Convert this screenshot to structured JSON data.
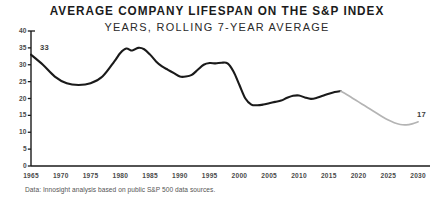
{
  "chart_data": {
    "type": "line",
    "title": "AVERAGE COMPANY LIFESPAN ON THE S&P INDEX",
    "subtitle": "YEARS, ROLLING 7-YEAR AVERAGE",
    "xlabel": "",
    "ylabel": "",
    "xlim": [
      1965,
      2032
    ],
    "ylim": [
      0,
      40
    ],
    "grid": false,
    "legend": "none",
    "xticks": [
      1965,
      1970,
      1975,
      1980,
      1985,
      1990,
      1995,
      2000,
      2005,
      2010,
      2015,
      2020,
      2025,
      2030
    ],
    "xtick_labels": [
      "1965",
      "1970",
      "1975",
      "1980",
      "1985",
      "1990",
      "1995",
      "2000",
      "2005",
      "2010",
      "2015",
      "2020",
      "2025",
      "2030"
    ],
    "yticks": [
      0,
      5,
      10,
      15,
      20,
      25,
      30,
      35,
      40
    ],
    "ytick_labels": [
      "0",
      "5",
      "10",
      "15",
      "20",
      "25",
      "30",
      "35",
      "40"
    ],
    "annotations": [
      {
        "text": "33",
        "x": 1966,
        "y": 33,
        "series": "historical"
      },
      {
        "text": "17",
        "x": 2030,
        "y": 13,
        "series": "projected"
      }
    ],
    "series": [
      {
        "name": "historical",
        "style": "solid",
        "color": "#1a1a1a",
        "x": [
          1965,
          1967,
          1969,
          1971,
          1973,
          1975,
          1977,
          1979,
          1980,
          1981,
          1982,
          1983,
          1984,
          1985,
          1986,
          1987,
          1988,
          1989,
          1990,
          1991,
          1992,
          1993,
          1994,
          1995,
          1996,
          1997,
          1998,
          1999,
          2000,
          2001,
          2002,
          2003,
          2004,
          2005,
          2006,
          2007,
          2008,
          2009,
          2010,
          2011,
          2012,
          2013,
          2014,
          2015,
          2016,
          2017
        ],
        "values": [
          33,
          30,
          26.5,
          24.5,
          24,
          24.5,
          26.5,
          31,
          33.5,
          34.8,
          34.2,
          35,
          34.6,
          33,
          31,
          29.5,
          28.5,
          27.5,
          26.5,
          26.5,
          27,
          28.5,
          30,
          30.5,
          30.4,
          30.6,
          30.4,
          28,
          24,
          20,
          18.2,
          18,
          18.2,
          18.6,
          19,
          19.4,
          20.2,
          20.8,
          20.9,
          20.3,
          19.9,
          20.2,
          20.8,
          21.4,
          21.9,
          22.2
        ]
      },
      {
        "name": "projected",
        "style": "solid",
        "color": "#b4b4b4",
        "x": [
          2017,
          2018,
          2019,
          2020,
          2021,
          2022,
          2023,
          2024,
          2025,
          2026,
          2027,
          2028,
          2029,
          2030
        ],
        "values": [
          22.2,
          21.2,
          20.1,
          19.0,
          17.9,
          16.8,
          15.7,
          14.6,
          13.6,
          12.8,
          12.3,
          12.2,
          12.5,
          13.1
        ]
      }
    ]
  },
  "source": {
    "note": "Data: Innosight analysis based on public S&P 500 data sources."
  },
  "colors": {
    "historical_line": "#1a1a1a",
    "projected_line": "#b4b4b4",
    "axis": "#1a1a1a",
    "tick_text": "#4a4a4a",
    "background": "#ffffff"
  }
}
